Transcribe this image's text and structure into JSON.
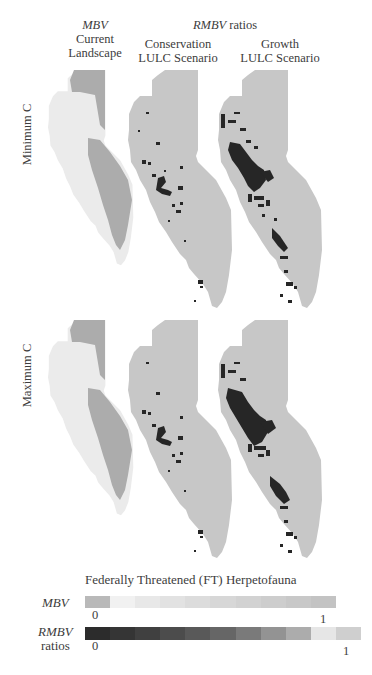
{
  "header": {
    "col1_line1": "MBV",
    "col1_line2": "Current",
    "col1_line3": "Landscape",
    "group_italic": "RMBV",
    "group_rest": " ratios",
    "col2_line1": "Conservation",
    "col2_line2": "LULC Scenario",
    "col3_line1": "Growth",
    "col3_line2": "LULC Scenario"
  },
  "rows": [
    {
      "label": "Minimum C"
    },
    {
      "label": "Maximum C"
    }
  ],
  "legend": {
    "title": "Federally Threatened (FT) Herpetofauna",
    "mbv_label": "MBV",
    "mbv_min": "0",
    "mbv_max": "1",
    "mbv_colors": [
      "#b9b9b9",
      "#f1f1f1",
      "#e8e8e8",
      "#e2e2e2",
      "#dcdcdc",
      "#d7d7d7",
      "#d2d2d2",
      "#cdcdcd",
      "#c8c8c8",
      "#c3c3c3"
    ],
    "rmbv_label_line1": "RMBV",
    "rmbv_label_line2": "ratios",
    "rmbv_min": "0",
    "rmbv_max": "1",
    "rmbv_colors": [
      "#2c2c2c",
      "#353535",
      "#404040",
      "#4c4c4c",
      "#595959",
      "#666666",
      "#7a7a7a",
      "#939393",
      "#acacac",
      "#e6e6e6",
      "#cfcfcf"
    ]
  },
  "colors": {
    "mbv_light": "#ececec",
    "mbv_dark": "#aeaeae",
    "rmbv_base": "#c6c6c6",
    "rmbv_hotspot": "#262626"
  }
}
